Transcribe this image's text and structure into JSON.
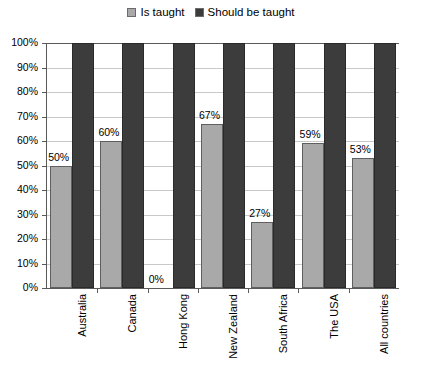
{
  "legend": {
    "position": "top-center",
    "entries": [
      {
        "label": "Is taught",
        "color": "#a9a9a9",
        "icon": "legend-swatch-icon"
      },
      {
        "label": "Should be taught",
        "color": "#3c3c3c",
        "icon": "legend-swatch-icon"
      }
    ]
  },
  "chart_data": {
    "type": "bar",
    "title": "",
    "subtitle": "",
    "xlabel": "",
    "ylabel": "",
    "ylim": [
      0,
      100
    ],
    "grid": true,
    "legend_position": "top-center",
    "categories": [
      "Australia",
      "Canada",
      "Hong Kong",
      "New Zealand",
      "South Africa",
      "The USA",
      "All countries"
    ],
    "ytick_labels": [
      "100%",
      "90%",
      "80%",
      "70%",
      "60%",
      "50%",
      "40%",
      "30%",
      "20%",
      "10%",
      "0%"
    ],
    "ytick_values": [
      100,
      90,
      80,
      70,
      60,
      50,
      40,
      30,
      20,
      10,
      0
    ],
    "series": [
      {
        "name": "Is taught",
        "color": "#a9a9a9",
        "values": [
          50,
          60,
          0,
          67,
          27,
          59,
          53
        ],
        "data_labels": [
          "50%",
          "60%",
          "0%",
          "67%",
          "27%",
          "59%",
          "53%"
        ]
      },
      {
        "name": "Should be taught",
        "color": "#3c3c3c",
        "values": [
          100,
          100,
          100,
          100,
          100,
          100,
          100
        ],
        "data_labels": [
          "",
          "",
          "",
          "",
          "",
          "",
          ""
        ]
      }
    ]
  }
}
